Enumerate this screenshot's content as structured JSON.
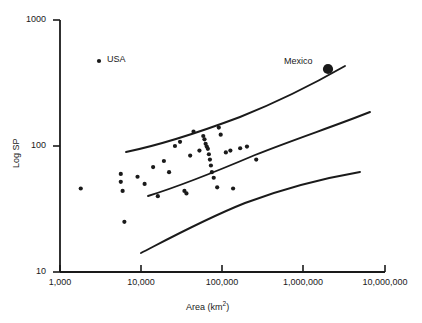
{
  "chart_data": {
    "type": "scatter",
    "title": "",
    "xlabel": "Area (km2)",
    "xlabel_base": "Area (km",
    "xlabel_sup": "2",
    "xlabel_close": ")",
    "ylabel": "Log SP",
    "x_scale": "log",
    "y_scale": "log",
    "xlim": [
      1000,
      10000000
    ],
    "ylim": [
      10,
      1000
    ],
    "grid": false,
    "legend_position": "upper-left-inside",
    "xticks": [
      1000,
      10000,
      100000,
      1000000,
      10000000
    ],
    "xtick_labels": [
      "1,000",
      "10,000",
      "100,000",
      "1,000,000",
      "10,000,000"
    ],
    "yticks": [
      10,
      100,
      1000
    ],
    "ytick_labels": [
      "10",
      "100",
      "1000"
    ],
    "annotations": [
      {
        "name": "usa-legend",
        "text": "USA",
        "x": 12000,
        "y": 390,
        "marker": "small-dot"
      },
      {
        "name": "mexico-label",
        "text": "Mexico",
        "x": 1960000,
        "y": 340,
        "marker": "large-dot"
      }
    ],
    "series": [
      {
        "name": "countries",
        "marker": "filled-circle",
        "color": "#1a1a1a",
        "points": [
          {
            "x": 1800,
            "y": 46
          },
          {
            "x": 5600,
            "y": 60
          },
          {
            "x": 5600,
            "y": 52
          },
          {
            "x": 5900,
            "y": 44
          },
          {
            "x": 6200,
            "y": 25
          },
          {
            "x": 9000,
            "y": 57
          },
          {
            "x": 11000,
            "y": 50
          },
          {
            "x": 14000,
            "y": 68
          },
          {
            "x": 16000,
            "y": 40
          },
          {
            "x": 19000,
            "y": 76
          },
          {
            "x": 22000,
            "y": 62
          },
          {
            "x": 26000,
            "y": 100
          },
          {
            "x": 30000,
            "y": 108
          },
          {
            "x": 34000,
            "y": 44
          },
          {
            "x": 36000,
            "y": 42
          },
          {
            "x": 40000,
            "y": 84
          },
          {
            "x": 44000,
            "y": 130
          },
          {
            "x": 52000,
            "y": 92
          },
          {
            "x": 58000,
            "y": 120
          },
          {
            "x": 60000,
            "y": 113
          },
          {
            "x": 62000,
            "y": 104
          },
          {
            "x": 64000,
            "y": 99
          },
          {
            "x": 66000,
            "y": 95
          },
          {
            "x": 68000,
            "y": 86
          },
          {
            "x": 70000,
            "y": 78
          },
          {
            "x": 72000,
            "y": 70
          },
          {
            "x": 74000,
            "y": 62
          },
          {
            "x": 78000,
            "y": 56
          },
          {
            "x": 86000,
            "y": 47
          },
          {
            "x": 90000,
            "y": 140
          },
          {
            "x": 95000,
            "y": 123
          },
          {
            "x": 110000,
            "y": 89
          },
          {
            "x": 125000,
            "y": 92
          },
          {
            "x": 135000,
            "y": 46
          },
          {
            "x": 165000,
            "y": 96
          },
          {
            "x": 200000,
            "y": 99
          },
          {
            "x": 260000,
            "y": 78
          },
          {
            "x": 1960000,
            "y": 340
          }
        ]
      }
    ],
    "curves": [
      {
        "name": "upper-confidence-band",
        "points": [
          [
            4600,
            88
          ],
          [
            10000,
            103
          ],
          [
            30000,
            133
          ],
          [
            100000,
            180
          ],
          [
            300000,
            240
          ],
          [
            1000000,
            320
          ],
          [
            3000000,
            420
          ],
          [
            5000000,
            470
          ]
        ]
      },
      {
        "name": "fitted-regression-line",
        "points": [
          [
            8200,
            35
          ],
          [
            20000,
            48
          ],
          [
            60000,
            68
          ],
          [
            200000,
            95
          ],
          [
            700000,
            132
          ],
          [
            2000000,
            165
          ],
          [
            6000000,
            200
          ]
        ]
      },
      {
        "name": "lower-confidence-band",
        "points": [
          [
            6800,
            13.5
          ],
          [
            20000,
            20
          ],
          [
            60000,
            29
          ],
          [
            200000,
            41
          ],
          [
            700000,
            54
          ],
          [
            2000000,
            62
          ],
          [
            4600000,
            66
          ]
        ]
      }
    ]
  }
}
